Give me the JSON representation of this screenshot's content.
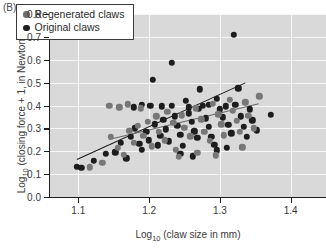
{
  "panel": {
    "label": "(B)"
  },
  "legend": {
    "entries": [
      {
        "label": "Regenerated claws",
        "marker": "filled-circle",
        "color": "#6e6e6e",
        "key": "regen"
      },
      {
        "label": "Original claws",
        "marker": "filled-circle",
        "color": "#1d1d1d",
        "key": "orig"
      }
    ]
  },
  "axes": {
    "y_label_prefix": "Log",
    "y_label_sub": "10",
    "y_label_suffix": " (closing force + 1, in Newtons)",
    "x_label_prefix": "Log",
    "x_label_sub": "10",
    "x_label_suffix": " (claw size in mm)",
    "y_ticks": [
      "0.0",
      "0.1",
      "0.2",
      "0.3",
      "0.4",
      "0.5",
      "0.6",
      "0.7",
      "0.8"
    ],
    "x_ticks": [
      "1.1",
      "1.2",
      "1.3",
      "1.4"
    ]
  },
  "chart_data": {
    "type": "scatter",
    "title": "",
    "xlabel": "Log10 (claw size in mm)",
    "ylabel": "Log10 (closing force + 1, in Newtons)",
    "xlim": [
      1.06,
      1.45
    ],
    "ylim": [
      0.0,
      0.8
    ],
    "xticks": [
      1.1,
      1.2,
      1.3,
      1.4
    ],
    "yticks": [
      0.0,
      0.1,
      0.2,
      0.3,
      0.4,
      0.5,
      0.6,
      0.7,
      0.8
    ],
    "grid": true,
    "grid_color": "#f7f7f7",
    "plot_background": "#d9d9d9",
    "legend_position": "upper-left",
    "series": [
      {
        "name": "Original claws",
        "color": "#1d1d1d",
        "marker": "circle",
        "points": [
          [
            1.098,
            0.132
          ],
          [
            1.104,
            0.128
          ],
          [
            1.122,
            0.158
          ],
          [
            1.139,
            0.19
          ],
          [
            1.152,
            0.196
          ],
          [
            1.16,
            0.238
          ],
          [
            1.168,
            0.17
          ],
          [
            1.174,
            0.262
          ],
          [
            1.18,
            0.3
          ],
          [
            1.186,
            0.232
          ],
          [
            1.19,
            0.206
          ],
          [
            1.196,
            0.284
          ],
          [
            1.2,
            0.248
          ],
          [
            1.205,
            0.512
          ],
          [
            1.208,
            0.318
          ],
          [
            1.212,
            0.226
          ],
          [
            1.216,
            0.268
          ],
          [
            1.22,
            0.338
          ],
          [
            1.224,
            0.296
          ],
          [
            1.228,
            0.244
          ],
          [
            1.232,
            0.4
          ],
          [
            1.236,
            0.352
          ],
          [
            1.24,
            0.31
          ],
          [
            1.244,
            0.272
          ],
          [
            1.248,
            0.224
          ],
          [
            1.252,
            0.42
          ],
          [
            1.256,
            0.366
          ],
          [
            1.26,
            0.33
          ],
          [
            1.264,
            0.288
          ],
          [
            1.268,
            0.258
          ],
          [
            1.272,
            0.47
          ],
          [
            1.276,
            0.398
          ],
          [
            1.28,
            0.344
          ],
          [
            1.284,
            0.306
          ],
          [
            1.288,
            0.262
          ],
          [
            1.292,
            0.228
          ],
          [
            1.296,
            0.43
          ],
          [
            1.3,
            0.384
          ],
          [
            1.304,
            0.348
          ],
          [
            1.308,
            0.396
          ],
          [
            1.312,
            0.316
          ],
          [
            1.316,
            0.278
          ],
          [
            1.32,
            0.71
          ],
          [
            1.322,
            0.404
          ],
          [
            1.326,
            0.476
          ],
          [
            1.33,
            0.352
          ],
          [
            1.334,
            0.308
          ],
          [
            1.338,
            0.264
          ],
          [
            1.342,
            0.384
          ],
          [
            1.346,
            0.336
          ],
          [
            1.352,
            0.292
          ],
          [
            1.372,
            0.36
          ],
          [
            1.218,
            0.396
          ],
          [
            1.256,
            0.392
          ],
          [
            1.27,
            0.386
          ],
          [
            1.284,
            0.404
          ],
          [
            1.244,
            0.19
          ],
          [
            1.262,
            0.178
          ],
          [
            1.296,
            0.204
          ],
          [
            1.31,
            0.216
          ],
          [
            1.178,
            0.392
          ],
          [
            1.19,
            0.404
          ],
          [
            1.202,
            0.398
          ],
          [
            1.232,
            0.588
          ]
        ]
      },
      {
        "name": "Regenerated claws",
        "color": "#777777",
        "marker": "circle",
        "points": [
          [
            1.116,
            0.13
          ],
          [
            1.134,
            0.15
          ],
          [
            1.146,
            0.262
          ],
          [
            1.156,
            0.214
          ],
          [
            1.164,
            0.184
          ],
          [
            1.172,
            0.29
          ],
          [
            1.178,
            0.236
          ],
          [
            1.184,
            0.312
          ],
          [
            1.192,
            0.268
          ],
          [
            1.198,
            0.33
          ],
          [
            1.204,
            0.222
          ],
          [
            1.21,
            0.352
          ],
          [
            1.214,
            0.286
          ],
          [
            1.222,
            0.248
          ],
          [
            1.226,
            0.372
          ],
          [
            1.234,
            0.324
          ],
          [
            1.238,
            0.206
          ],
          [
            1.246,
            0.358
          ],
          [
            1.25,
            0.302
          ],
          [
            1.258,
            0.266
          ],
          [
            1.266,
            0.388
          ],
          [
            1.274,
            0.34
          ],
          [
            1.278,
            0.286
          ],
          [
            1.286,
            0.246
          ],
          [
            1.29,
            0.408
          ],
          [
            1.298,
            0.362
          ],
          [
            1.302,
            0.318
          ],
          [
            1.306,
            0.27
          ],
          [
            1.314,
            0.424
          ],
          [
            1.318,
            0.378
          ],
          [
            1.324,
            0.332
          ],
          [
            1.328,
            0.286
          ],
          [
            1.336,
            0.414
          ],
          [
            1.34,
            0.356
          ],
          [
            1.348,
            0.3
          ],
          [
            1.356,
            0.44
          ],
          [
            1.144,
            0.398
          ],
          [
            1.158,
            0.392
          ],
          [
            1.17,
            0.406
          ],
          [
            1.188,
            0.388
          ],
          [
            1.242,
            0.176
          ],
          [
            1.268,
            0.192
          ],
          [
            1.294,
            0.182
          ],
          [
            1.332,
            0.218
          ]
        ]
      }
    ],
    "fit_lines": [
      {
        "name": "Original claws fit",
        "color": "#1a1a1a",
        "x_start": 1.098,
        "y_start": 0.165,
        "x_end": 1.336,
        "y_end": 0.5
      },
      {
        "name": "Regenerated claws fit",
        "color": "#6a6a6a",
        "x_start": 1.144,
        "y_start": 0.255,
        "x_end": 1.356,
        "y_end": 0.412
      }
    ]
  }
}
